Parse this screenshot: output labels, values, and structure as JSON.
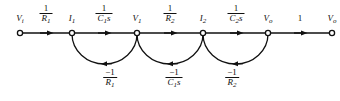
{
  "diagram": {
    "type": "signal-flow-graph",
    "title": "",
    "width": 340,
    "height": 101,
    "background_color": "#ffffff",
    "line_color": "#111111",
    "baseline_y": 33,
    "nodes": [
      {
        "id": "n1",
        "label_main": "V",
        "label_sub": "i",
        "x": 20,
        "y": 33
      },
      {
        "id": "n2",
        "label_main": "I",
        "label_sub": "1",
        "x": 72,
        "y": 33
      },
      {
        "id": "n3",
        "label_main": "V",
        "label_sub": "1",
        "x": 137,
        "y": 33
      },
      {
        "id": "n4",
        "label_main": "I",
        "label_sub": "2",
        "x": 203,
        "y": 33
      },
      {
        "id": "n5",
        "label_main": "V",
        "label_sub": "o",
        "x": 268,
        "y": 33
      },
      {
        "id": "n6",
        "label_main": "V",
        "label_sub": "o",
        "x": 332,
        "y": 33
      }
    ],
    "forward_branches": [
      {
        "from": "n1",
        "to": "n2",
        "numerator": "1",
        "denominator_main": "R",
        "denominator_sub": "1",
        "denominator_tail": "",
        "label_x": 46,
        "label_y": 4
      },
      {
        "from": "n2",
        "to": "n3",
        "numerator": "1",
        "denominator_main": "C",
        "denominator_sub": "1",
        "denominator_tail": "s",
        "label_x": 104,
        "label_y": 4
      },
      {
        "from": "n3",
        "to": "n4",
        "numerator": "1",
        "denominator_main": "R",
        "denominator_sub": "2",
        "denominator_tail": "",
        "label_x": 170,
        "label_y": 4
      },
      {
        "from": "n4",
        "to": "n5",
        "numerator": "1",
        "denominator_main": "C",
        "denominator_sub": "2",
        "denominator_tail": "s",
        "label_x": 236,
        "label_y": 4
      },
      {
        "from": "n5",
        "to": "n6",
        "plain": "1",
        "label_x": 300,
        "label_y": 14
      }
    ],
    "feedback_branches": [
      {
        "from": "n3",
        "to": "n2",
        "numerator": "−1",
        "denominator_main": "R",
        "denominator_sub": "1",
        "denominator_tail": "",
        "label_x": 110,
        "label_y": 68
      },
      {
        "from": "n4",
        "to": "n3",
        "numerator": "−1",
        "denominator_main": "C",
        "denominator_sub": "1",
        "denominator_tail": "s",
        "label_x": 174,
        "label_y": 68
      },
      {
        "from": "n5",
        "to": "n4",
        "numerator": "−1",
        "denominator_main": "R",
        "denominator_sub": "2",
        "denominator_tail": "",
        "label_x": 232,
        "label_y": 68
      }
    ]
  }
}
